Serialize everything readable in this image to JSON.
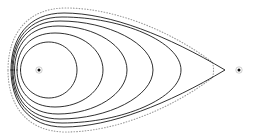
{
  "figure": {
    "background_color": "#ffffff",
    "stroke_color": "#1a1a1a",
    "dotted_stroke_color": "#8a8a8a",
    "width": 255,
    "height": 136
  },
  "foci": [
    {
      "name": "left-focus",
      "label": "F1",
      "x": 39,
      "y": 70,
      "radius": 1.5
    },
    {
      "name": "right-focus",
      "label": "F2",
      "x": 239,
      "y": 70,
      "radius": 1.5
    }
  ],
  "curves": [
    {
      "name": "oval-1-innermost",
      "style": "solid",
      "stroke_width": 0.9,
      "left_x": 20.5,
      "right_x": 77,
      "top_y": 42,
      "bottom_y": 98,
      "cusp": false,
      "path": "M 20.5 70 C 20.5 54.5 33.2 42.0 48.8 42.0 C 64.4 42.0 77.0 54.5 77.0 70.0 C 77.0 85.5 64.4 98.0 48.8 98.0 C 33.2 98.0 20.5 85.5 20.5 70.0 Z"
    },
    {
      "name": "oval-2",
      "style": "solid",
      "stroke_width": 0.9,
      "left_x": 17,
      "right_x": 103,
      "top_y": 33,
      "bottom_y": 107,
      "cusp": false,
      "path": "M 17.0 70 C 17.0 49.5 30.0 33.0 55.0 33.0 C 82.0 33.0 103.0 50.0 103.0 70.0 C 103.0 90.0 82.0 107.0 55.0 107.0 C 30.0 107.0 17.0 90.5 17.0 70.0 Z"
    },
    {
      "name": "oval-3",
      "style": "solid",
      "stroke_width": 0.9,
      "left_x": 14.5,
      "right_x": 127,
      "top_y": 26,
      "bottom_y": 114,
      "cusp": false,
      "path": "M 14.5 70 C 14.5 45.5 29.0 26.0 58.0 26.0 C 95.0 26.0 127.0 46.0 127.0 70.0 C 127.0 94.0 95.0 114.0 58.0 114.0 C 29.0 114.0 14.5 94.5 14.5 70.0 Z"
    },
    {
      "name": "oval-4",
      "style": "solid",
      "stroke_width": 0.9,
      "left_x": 13,
      "right_x": 153,
      "top_y": 21,
      "bottom_y": 119,
      "cusp": false,
      "path": "M 13.0 70 C 13.0 42.5 28.5 21.0 60.0 21.0 C 108.0 21.0 153.0 43.5 153.0 70.0 C 153.0 96.5 108.0 119.0 60.0 119.0 C 28.5 119.0 13.0 97.5 13.0 70.0 Z"
    },
    {
      "name": "oval-5",
      "style": "solid",
      "stroke_width": 0.9,
      "left_x": 12,
      "right_x": 181,
      "top_y": 17,
      "bottom_y": 123,
      "cusp": false,
      "path": "M 12.0 70 C 12.0 40.5 28.0 17.0 62.0 17.0 C 122.0 17.0 181.0 42.0 181.0 70.0 C 181.0 98.0 122.0 123.0 62.0 123.0 C 28.0 123.0 12.0 99.5 12.0 70.0 Z"
    },
    {
      "name": "oval-6-outermost-cusped",
      "style": "solid",
      "stroke_width": 0.9,
      "left_x": 11,
      "right_x": 225,
      "top_y": 13,
      "bottom_y": 127,
      "cusp": true,
      "cusp_x": 225,
      "cusp_y": 70,
      "path": "M 11.0 70 C 11.0 38.5 27.5 13.0 64.0 13.0 C 110.0 13.0 168.0 36.0 225.0 70.0 C 168.0 104.0 110.0 127.0 64.0 127.0 C 27.5 127.0 11.0 101.5 11.0 70.0 Z"
    },
    {
      "name": "oval-7-dotted-envelope",
      "style": "dotted",
      "stroke_width": 1.1,
      "left_x": 8,
      "right_x": 212,
      "top_y": 8,
      "bottom_y": 132,
      "cusp": false,
      "path": "M 8.0 70 C 8.0 35.5 26.0 8.0 66.0 8.0 C 116.0 8.0 172.0 32.0 212.0 62.0 C 214.0 64.5 214.0 75.5 212.0 78.0 C 172.0 108.0 116.0 132.0 66.0 132.0 C 26.0 132.0 8.0 104.5 8.0 70.0 Z"
    }
  ],
  "counts": {
    "solid_curves": 6,
    "dotted_curves": 1,
    "focus_points": 2
  }
}
